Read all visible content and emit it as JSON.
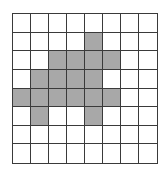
{
  "grid": {
    "rows": 8,
    "cols": 8,
    "fill_color": "#a8a8a8",
    "line_color": "#3a3a3a",
    "filled_cells": [
      [
        1,
        4
      ],
      [
        2,
        2
      ],
      [
        2,
        3
      ],
      [
        2,
        4
      ],
      [
        2,
        5
      ],
      [
        3,
        1
      ],
      [
        3,
        2
      ],
      [
        3,
        3
      ],
      [
        3,
        4
      ],
      [
        4,
        0
      ],
      [
        4,
        1
      ],
      [
        4,
        2
      ],
      [
        4,
        3
      ],
      [
        4,
        4
      ],
      [
        4,
        5
      ],
      [
        5,
        1
      ],
      [
        5,
        4
      ]
    ]
  }
}
